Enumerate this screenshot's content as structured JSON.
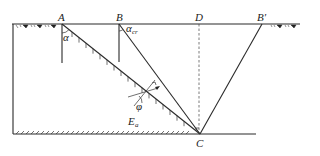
{
  "figure": {
    "type": "retaining-wall-earth-pressure-wedge-diagram",
    "points": {
      "A": {
        "label": "A",
        "x": 62,
        "y": 24
      },
      "B": {
        "label": "B",
        "x": 119,
        "y": 24
      },
      "D": {
        "label": "D",
        "x": 199,
        "y": 24
      },
      "B_prime": {
        "label": "B′",
        "x": 262,
        "y": 24
      },
      "C": {
        "label": "C",
        "x": 200,
        "y": 134
      }
    },
    "angles": {
      "alpha": {
        "label": "α"
      },
      "alpha_cr": {
        "label": "α",
        "subscript": "cr"
      },
      "phi": {
        "label": "φ"
      }
    },
    "forces": {
      "Ea": {
        "label": "E",
        "subscript": "a"
      }
    },
    "lines": [
      {
        "name": "ground-surface",
        "from": "left-edge",
        "to": "right-edge"
      },
      {
        "name": "slip-plane-AC",
        "from": "A",
        "to": "C",
        "hatched": true
      },
      {
        "name": "critical-plane-BC",
        "from": "B",
        "to": "C"
      },
      {
        "name": "passive-plane-BprimeC",
        "from": "B′",
        "to": "C"
      },
      {
        "name": "vertical-DC",
        "from": "D",
        "to": "C",
        "style": "dashed"
      },
      {
        "name": "base-line",
        "hatched": true
      },
      {
        "name": "left-wall"
      }
    ]
  },
  "colors": {
    "line": "#2a2a2a",
    "background": "#ffffff"
  }
}
